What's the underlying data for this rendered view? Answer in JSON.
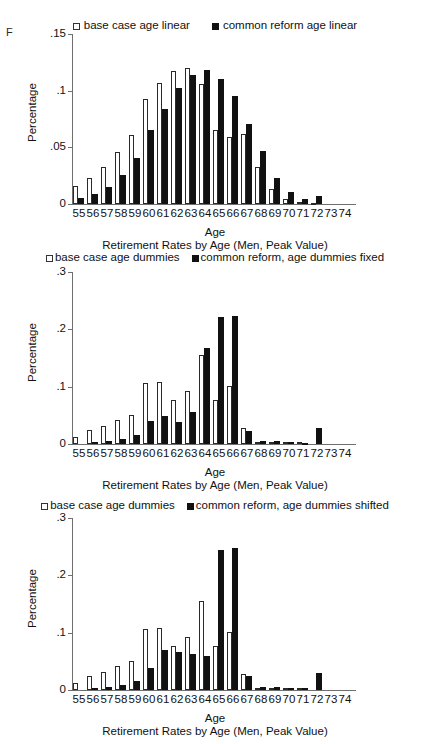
{
  "panel": {
    "letter": "F"
  },
  "shared": {
    "xlabel": "Age",
    "ylabel": "Percentage",
    "subtitle": "Retirement Rates by Age (Men, Peak Value)",
    "ages": [
      "55",
      "56",
      "57",
      "58",
      "59",
      "60",
      "61",
      "62",
      "63",
      "64",
      "65",
      "66",
      "67",
      "68",
      "69",
      "70",
      "71",
      "72",
      "73",
      "74"
    ],
    "colors": {
      "base_case": "#ffffff",
      "common_reform": "#111111",
      "axis": "#6f6f6f",
      "text": "#111111"
    }
  },
  "chart_data": [
    {
      "id": "chart-age-linear",
      "type": "bar",
      "title": "Retirement Rates by Age (Men, Peak Value)",
      "xlabel": "Age",
      "ylabel": "Percentage",
      "ylim": [
        0,
        0.15
      ],
      "yticks": [
        0,
        0.05,
        0.1,
        0.15
      ],
      "ytick_labels": [
        "0",
        ".05",
        ".1",
        ".15"
      ],
      "grid": false,
      "legend_position": "top",
      "categories": [
        "55",
        "56",
        "57",
        "58",
        "59",
        "60",
        "61",
        "62",
        "63",
        "64",
        "65",
        "66",
        "67",
        "68",
        "69",
        "70",
        "71",
        "72",
        "73",
        "74"
      ],
      "series": [
        {
          "name": "base case age linear",
          "style": "open",
          "values": [
            0.016,
            0.023,
            0.033,
            0.046,
            0.061,
            0.093,
            0.107,
            0.117,
            0.12,
            0.106,
            0.065,
            0.059,
            0.062,
            0.033,
            0.013,
            0.004,
            0.002,
            0.001,
            0.0,
            0.0
          ]
        },
        {
          "name": "common reform age linear",
          "style": "solid",
          "values": [
            0.005,
            0.009,
            0.015,
            0.026,
            0.041,
            0.065,
            0.084,
            0.102,
            0.114,
            0.118,
            0.11,
            0.095,
            0.071,
            0.047,
            0.023,
            0.011,
            0.004,
            0.007,
            0.0,
            0.0
          ]
        }
      ]
    },
    {
      "id": "chart-age-dummies-fixed",
      "type": "bar",
      "title": "Retirement Rates by Age (Men, Peak Value)",
      "xlabel": "Age",
      "ylabel": "Percentage",
      "ylim": [
        0,
        0.3
      ],
      "yticks": [
        0,
        0.1,
        0.2,
        0.3
      ],
      "ytick_labels": [
        "0",
        ".1",
        ".2",
        ".3"
      ],
      "grid": false,
      "legend_position": "top",
      "categories": [
        "55",
        "56",
        "57",
        "58",
        "59",
        "60",
        "61",
        "62",
        "63",
        "64",
        "65",
        "66",
        "67",
        "68",
        "69",
        "70",
        "71",
        "72",
        "73",
        "74"
      ],
      "series": [
        {
          "name": "base case age dummies",
          "style": "open",
          "values": [
            0.013,
            0.024,
            0.031,
            0.042,
            0.05,
            0.107,
            0.108,
            0.076,
            0.093,
            0.155,
            0.076,
            0.102,
            0.028,
            0.004,
            0.003,
            0.003,
            0.003,
            0.0,
            0.0,
            0.0
          ]
        },
        {
          "name": "common reform, age dummies fixed",
          "style": "solid",
          "values": [
            0.0,
            0.003,
            0.005,
            0.009,
            0.015,
            0.04,
            0.048,
            0.038,
            0.056,
            0.168,
            0.222,
            0.224,
            0.023,
            0.006,
            0.005,
            0.004,
            0.002,
            0.028,
            0.0,
            0.0
          ]
        }
      ]
    },
    {
      "id": "chart-age-dummies-shifted",
      "type": "bar",
      "title": "Retirement Rates by Age (Men, Peak Value)",
      "xlabel": "Age",
      "ylabel": "Percentage",
      "ylim": [
        0,
        0.3
      ],
      "yticks": [
        0,
        0.1,
        0.2,
        0.3
      ],
      "ytick_labels": [
        "0",
        ".1",
        ".2",
        ".3"
      ],
      "grid": false,
      "legend_position": "top",
      "categories": [
        "55",
        "56",
        "57",
        "58",
        "59",
        "60",
        "61",
        "62",
        "63",
        "64",
        "65",
        "66",
        "67",
        "68",
        "69",
        "70",
        "71",
        "72",
        "73",
        "74"
      ],
      "series": [
        {
          "name": "base case age dummies",
          "style": "open",
          "values": [
            0.013,
            0.024,
            0.031,
            0.042,
            0.05,
            0.107,
            0.108,
            0.076,
            0.093,
            0.155,
            0.076,
            0.102,
            0.028,
            0.004,
            0.003,
            0.003,
            0.003,
            0.0,
            0.0,
            0.0
          ]
        },
        {
          "name": "common reform, age dummies shifted",
          "style": "solid",
          "values": [
            0.0,
            0.003,
            0.006,
            0.009,
            0.015,
            0.039,
            0.069,
            0.066,
            0.063,
            0.06,
            0.245,
            0.248,
            0.025,
            0.005,
            0.005,
            0.004,
            0.004,
            0.029,
            0.0,
            0.0
          ]
        }
      ]
    }
  ],
  "charts": [
    {
      "legend": [
        {
          "label": "base case age linear",
          "style": "open"
        },
        {
          "label": "common reform age linear",
          "style": "solid"
        }
      ],
      "ytick_labels": [
        "0",
        ".05",
        ".1",
        ".15"
      ],
      "xlabel": "Age",
      "ylabel": "Percentage",
      "subtitle": "Retirement Rates by Age (Men, Peak Value)"
    },
    {
      "legend": [
        {
          "label": "base case age dummies",
          "style": "open"
        },
        {
          "label": "common reform, age dummies fixed",
          "style": "solid"
        }
      ],
      "ytick_labels": [
        "0",
        ".1",
        ".2",
        ".3"
      ],
      "xlabel": "Age",
      "ylabel": "Percentage",
      "subtitle": "Retirement Rates by Age (Men, Peak Value)"
    },
    {
      "legend": [
        {
          "label": "base case age dummies",
          "style": "open"
        },
        {
          "label": "common reform, age dummies shifted",
          "style": "solid"
        }
      ],
      "ytick_labels": [
        "0",
        ".1",
        ".2",
        ".3"
      ],
      "xlabel": "Age",
      "ylabel": "Percentage",
      "subtitle": "Retirement Rates by Age (Men, Peak Value)"
    }
  ]
}
